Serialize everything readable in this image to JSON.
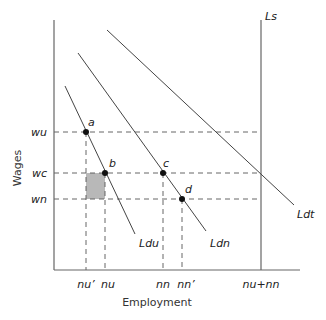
{
  "diagram": {
    "axes": {
      "y_title": "Wages",
      "x_title": "Employment"
    },
    "supply": {
      "label": "Ls"
    },
    "demand_curves": [
      {
        "id": "du",
        "label": "Ldu"
      },
      {
        "id": "dn",
        "label": "Ldn"
      },
      {
        "id": "dt",
        "label": "Ldt"
      }
    ],
    "wage_levels": [
      {
        "id": "wu",
        "label": "wu"
      },
      {
        "id": "wc",
        "label": "wc"
      },
      {
        "id": "wn",
        "label": "wn"
      }
    ],
    "employment_levels": [
      {
        "id": "nu_prime",
        "label": "nu’"
      },
      {
        "id": "nu",
        "label": "nu"
      },
      {
        "id": "nn",
        "label": "nn"
      },
      {
        "id": "nn_prime",
        "label": "nn’"
      },
      {
        "id": "nu_plus_nn",
        "label": "nu+nn"
      }
    ],
    "points": [
      {
        "id": "a",
        "label": "a"
      },
      {
        "id": "b",
        "label": "b"
      },
      {
        "id": "c",
        "label": "c"
      },
      {
        "id": "d",
        "label": "d"
      }
    ],
    "colors": {
      "shaded_area": "#b8b8b8",
      "lines": "#444444",
      "points": "#111111"
    }
  }
}
